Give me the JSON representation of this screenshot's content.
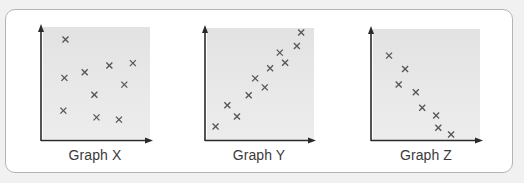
{
  "figure": {
    "background": "#f1f1f1",
    "card_border": "#b4b4b4",
    "plot_background": "#e6e6e6",
    "axis_color": "#2a2a2a",
    "marker_color": "#555555",
    "marker": "x-cross"
  },
  "graphs": [
    {
      "label": "Graph X",
      "correlation": "none"
    },
    {
      "label": "Graph Y",
      "correlation": "positive"
    },
    {
      "label": "Graph Z",
      "correlation": "negative"
    }
  ],
  "chart_data": [
    {
      "type": "scatter",
      "title": "Graph X",
      "xlabel": "",
      "ylabel": "",
      "grid": false,
      "axis_ticks": false,
      "xlim": [
        0,
        100
      ],
      "ylim": [
        0,
        100
      ],
      "x": [
        21,
        20,
        39,
        62,
        84,
        76,
        48,
        19,
        50,
        71
      ],
      "y": [
        89,
        55,
        60,
        66,
        68,
        49,
        40,
        26,
        20,
        18
      ]
    },
    {
      "type": "scatter",
      "title": "Graph Y",
      "xlabel": "",
      "ylabel": "",
      "grid": false,
      "axis_ticks": false,
      "xlim": [
        0,
        100
      ],
      "ylim": [
        0,
        100
      ],
      "x": [
        8,
        19,
        28,
        39,
        45,
        54,
        59,
        68,
        73,
        84,
        88
      ],
      "y": [
        12,
        31,
        21,
        40,
        55,
        47,
        64,
        78,
        69,
        84,
        96
      ]
    },
    {
      "type": "scatter",
      "title": "Graph Z",
      "xlabel": "",
      "ylabel": "",
      "grid": false,
      "axis_ticks": false,
      "xlim": [
        0,
        100
      ],
      "ylim": [
        0,
        100
      ],
      "x": [
        15,
        30,
        24,
        40,
        46,
        59,
        61,
        73
      ],
      "y": [
        76,
        64,
        50,
        43,
        29,
        22,
        11,
        5
      ]
    }
  ]
}
